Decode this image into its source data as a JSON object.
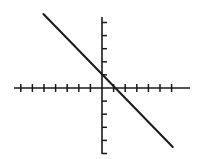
{
  "chart_data": {
    "type": "line",
    "title": "",
    "subtitle": "",
    "xlabel": "",
    "ylabel": "",
    "grid": false,
    "legend": false,
    "legend_position": "none",
    "axis_style": "centered-cross",
    "tick_labels_visible": false,
    "x_tick_labels": [],
    "y_tick_labels": [],
    "xlim": [
      -7.5,
      7.5
    ],
    "ylim": [
      -5.4,
      5.4
    ],
    "x_ticks": [
      -7,
      -6,
      -5,
      -4,
      -3,
      -2,
      -1,
      1,
      2,
      3,
      4,
      5,
      6
    ],
    "y_ticks": [
      -5,
      -4,
      -3,
      -2,
      -1,
      1,
      2,
      3,
      4,
      5
    ],
    "series": [
      {
        "name": "line",
        "type": "line",
        "slope": -1.0,
        "intercept": 0.6,
        "color": "#1a1a1a",
        "x": [
          -5.05,
          6.1
        ],
        "y": [
          5.65,
          -4.5
        ],
        "points": [
          {
            "x": -5.05,
            "y": 5.65
          },
          {
            "x": 6.1,
            "y": -4.5
          }
        ]
      }
    ],
    "x_intercept": 0.6,
    "y_intercept": 0.6,
    "annotations": []
  },
  "geometry": {
    "width": 201,
    "height": 159,
    "origin_x": 102,
    "origin_y": 88,
    "x_axis_start": 14,
    "x_axis_end": 190,
    "y_axis_top": 17,
    "y_axis_bottom": 154,
    "x_tick_spacing": 11.6,
    "x_tick_half_len": 4,
    "y_tick_spacing": 13.1,
    "y_tick_len": 5,
    "line_x1": 44,
    "line_y1": 19,
    "line_x2": 172,
    "line_y2": 146
  },
  "colors": {
    "background": "#ffffff",
    "axis": "#1a1a1a",
    "line": "#1a1a1a"
  }
}
